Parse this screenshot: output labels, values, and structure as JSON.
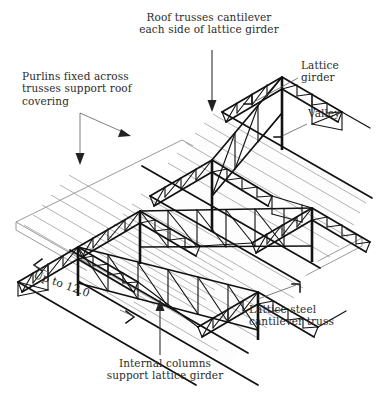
{
  "figure": {
    "title_alt": "Isometric view of lattice steel roof with cantilever trusses",
    "type": "isometric-technical-diagram",
    "ink_color": "#111111",
    "text_color": "#2b2b2b",
    "purlin_color": "#9a9a9a",
    "leader_color": "#5d5d5d",
    "background": "#ffffff"
  },
  "labels": {
    "roof_trusses": "Roof trusses cantilever\neach side of lattice girder",
    "purlins": "Purlins fixed across\ntrusses support roof\ncovering",
    "lattice_girder": "Lattice\ngirder",
    "valley": "Valley",
    "lattice_steel_cantilever_truss": "Lattice steel\ncantilever truss",
    "internal_columns": "Internal columns\nsupport lattice girder",
    "span_dimension": "Up to 12.0"
  },
  "annotations": [
    {
      "name": "roof-trusses-callout",
      "text": "Roof trusses cantilever each side of lattice girder",
      "leader": "vertical-arrow-down"
    },
    {
      "name": "purlins-callout",
      "text": "Purlins fixed across trusses support roof covering",
      "leader": "bracket-two-arrows"
    },
    {
      "name": "lattice-girder-callout",
      "text": "Lattice girder",
      "leader": "diagonal-bent-arrow"
    },
    {
      "name": "valley-callout",
      "text": "Valley",
      "leader": "diagonal-bent-arrow"
    },
    {
      "name": "cantilever-truss-callout",
      "text": "Lattice steel cantilever truss",
      "leader": "diagonal-bent-arrow"
    },
    {
      "name": "internal-columns-callout",
      "text": "Internal columns support lattice girder",
      "leader": "vertical-arrow-up"
    },
    {
      "name": "span-dimension",
      "text": "Up to 12.0",
      "leader": "double-ended-dimension-arrows"
    }
  ]
}
